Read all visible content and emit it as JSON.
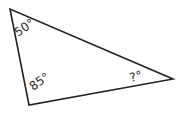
{
  "diagram": {
    "type": "triangle",
    "stroke_color": "#222222",
    "background": "#ffffff",
    "vertices": {
      "top_left": [
        10,
        9
      ],
      "bottom_left": [
        29,
        105
      ],
      "right": [
        173,
        79
      ]
    },
    "angles": [
      {
        "vertex": "top_left",
        "label": "50°"
      },
      {
        "vertex": "bottom_left",
        "label": "85°"
      },
      {
        "vertex": "right",
        "label": "?°"
      }
    ]
  }
}
